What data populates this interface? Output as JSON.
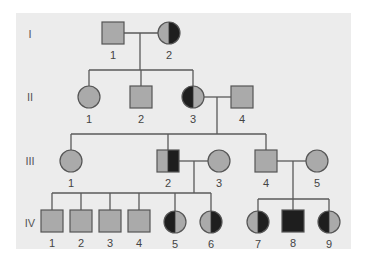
{
  "colors": {
    "background": "#ffffff",
    "panel": "#ececec",
    "unaffected": "#aaaaaa",
    "affected": "#1e1e1e",
    "line": "#5a5a5a"
  },
  "generations": [
    {
      "label": "I",
      "y": 34
    },
    {
      "label": "II",
      "y": 97
    },
    {
      "label": "III",
      "y": 161
    },
    {
      "label": "IV",
      "y": 223
    }
  ],
  "individuals": [
    {
      "id": "I-1",
      "gen": "I",
      "num": "1",
      "sex": "male",
      "shading": "none",
      "cx": 113,
      "cy": 33
    },
    {
      "id": "I-2",
      "gen": "I",
      "num": "2",
      "sex": "female",
      "shading": "right",
      "cx": 169,
      "cy": 33
    },
    {
      "id": "II-1",
      "gen": "II",
      "num": "1",
      "sex": "female",
      "shading": "none",
      "cx": 89,
      "cy": 97
    },
    {
      "id": "II-2",
      "gen": "II",
      "num": "2",
      "sex": "male",
      "shading": "none",
      "cx": 141,
      "cy": 97
    },
    {
      "id": "II-3",
      "gen": "II",
      "num": "3",
      "sex": "female",
      "shading": "left",
      "cx": 193,
      "cy": 97
    },
    {
      "id": "II-4",
      "gen": "II",
      "num": "4",
      "sex": "male",
      "shading": "none",
      "cx": 242,
      "cy": 97
    },
    {
      "id": "III-1",
      "gen": "III",
      "num": "1",
      "sex": "female",
      "shading": "none",
      "cx": 71,
      "cy": 161
    },
    {
      "id": "III-2",
      "gen": "III",
      "num": "2",
      "sex": "male",
      "shading": "right",
      "cx": 168,
      "cy": 161
    },
    {
      "id": "III-3",
      "gen": "III",
      "num": "3",
      "sex": "female",
      "shading": "none",
      "cx": 219,
      "cy": 161
    },
    {
      "id": "III-4",
      "gen": "III",
      "num": "4",
      "sex": "male",
      "shading": "none",
      "cx": 266,
      "cy": 161
    },
    {
      "id": "III-5",
      "gen": "III",
      "num": "5",
      "sex": "female",
      "shading": "none",
      "cx": 317,
      "cy": 161
    },
    {
      "id": "IV-1",
      "gen": "IV",
      "num": "1",
      "sex": "male",
      "shading": "none",
      "cx": 52,
      "cy": 221
    },
    {
      "id": "IV-2",
      "gen": "IV",
      "num": "2",
      "sex": "male",
      "shading": "none",
      "cx": 81,
      "cy": 221
    },
    {
      "id": "IV-3",
      "gen": "IV",
      "num": "3",
      "sex": "male",
      "shading": "none",
      "cx": 110,
      "cy": 221
    },
    {
      "id": "IV-4",
      "gen": "IV",
      "num": "4",
      "sex": "male",
      "shading": "none",
      "cx": 139,
      "cy": 221
    },
    {
      "id": "IV-5",
      "gen": "IV",
      "num": "5",
      "sex": "female",
      "shading": "left",
      "cx": 175,
      "cy": 222
    },
    {
      "id": "IV-6",
      "gen": "IV",
      "num": "6",
      "sex": "female",
      "shading": "right",
      "cx": 211,
      "cy": 222
    },
    {
      "id": "IV-7",
      "gen": "IV",
      "num": "7",
      "sex": "female",
      "shading": "right",
      "cx": 258,
      "cy": 222
    },
    {
      "id": "IV-8",
      "gen": "IV",
      "num": "8",
      "sex": "male",
      "shading": "full",
      "cx": 293,
      "cy": 221
    },
    {
      "id": "IV-9",
      "gen": "IV",
      "num": "9",
      "sex": "female",
      "shading": "left",
      "cx": 329,
      "cy": 222
    }
  ],
  "lines": [
    {
      "name": "marriage-I1-I2",
      "x1": 123,
      "y1": 33,
      "x2": 158,
      "y2": 33
    },
    {
      "name": "descent-I",
      "x1": 140,
      "y1": 33,
      "x2": 140,
      "y2": 70
    },
    {
      "name": "sibship-II",
      "x1": 89,
      "y1": 70,
      "x2": 193,
      "y2": 70
    },
    {
      "name": "drop-II1",
      "x1": 89,
      "y1": 70,
      "x2": 89,
      "y2": 86
    },
    {
      "name": "drop-II2",
      "x1": 141,
      "y1": 70,
      "x2": 141,
      "y2": 86
    },
    {
      "name": "drop-II3",
      "x1": 193,
      "y1": 70,
      "x2": 193,
      "y2": 86
    },
    {
      "name": "marriage-II3-II4",
      "x1": 204,
      "y1": 97,
      "x2": 232,
      "y2": 97
    },
    {
      "name": "descent-II",
      "x1": 217,
      "y1": 97,
      "x2": 217,
      "y2": 134
    },
    {
      "name": "sibship-III",
      "x1": 71,
      "y1": 134,
      "x2": 266,
      "y2": 134
    },
    {
      "name": "drop-III1",
      "x1": 71,
      "y1": 134,
      "x2": 71,
      "y2": 150
    },
    {
      "name": "drop-III2",
      "x1": 168,
      "y1": 134,
      "x2": 168,
      "y2": 150
    },
    {
      "name": "drop-III4",
      "x1": 266,
      "y1": 134,
      "x2": 266,
      "y2": 150
    },
    {
      "name": "marriage-III2-III3",
      "x1": 179,
      "y1": 161,
      "x2": 208,
      "y2": 161
    },
    {
      "name": "descent-III2",
      "x1": 194,
      "y1": 161,
      "x2": 194,
      "y2": 193
    },
    {
      "name": "sibship-IV-left",
      "x1": 52,
      "y1": 193,
      "x2": 211,
      "y2": 193
    },
    {
      "name": "drop-IV1",
      "x1": 52,
      "y1": 193,
      "x2": 52,
      "y2": 210
    },
    {
      "name": "drop-IV2",
      "x1": 81,
      "y1": 193,
      "x2": 81,
      "y2": 210
    },
    {
      "name": "drop-IV3",
      "x1": 110,
      "y1": 193,
      "x2": 110,
      "y2": 210
    },
    {
      "name": "drop-IV4",
      "x1": 139,
      "y1": 193,
      "x2": 139,
      "y2": 210
    },
    {
      "name": "drop-IV5",
      "x1": 175,
      "y1": 193,
      "x2": 175,
      "y2": 211
    },
    {
      "name": "drop-IV6",
      "x1": 211,
      "y1": 193,
      "x2": 211,
      "y2": 211
    },
    {
      "name": "marriage-III4-III5",
      "x1": 276,
      "y1": 161,
      "x2": 306,
      "y2": 161
    },
    {
      "name": "descent-III4",
      "x1": 293,
      "y1": 161,
      "x2": 293,
      "y2": 199
    },
    {
      "name": "sibship-IV-right",
      "x1": 258,
      "y1": 199,
      "x2": 329,
      "y2": 199
    },
    {
      "name": "drop-IV7",
      "x1": 258,
      "y1": 199,
      "x2": 258,
      "y2": 211
    },
    {
      "name": "drop-IV8",
      "x1": 293,
      "y1": 199,
      "x2": 293,
      "y2": 210
    },
    {
      "name": "drop-IV9",
      "x1": 329,
      "y1": 199,
      "x2": 329,
      "y2": 211
    }
  ]
}
